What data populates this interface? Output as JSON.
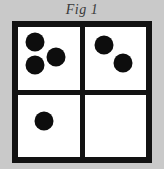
{
  "figure": {
    "caption": "Fig 1",
    "colors": {
      "background": "#c9c9c9",
      "frame": "#121212",
      "cell": "#ffffff",
      "dot": "#0d0d0d"
    },
    "frame": {
      "border_px": 6,
      "divider_px": 5
    },
    "quadrants": [
      {
        "name": "top-left",
        "dot_count": 3,
        "dots": [
          {
            "cx_pct": 28,
            "cy_pct": 24,
            "d_px": 19
          },
          {
            "cx_pct": 27,
            "cy_pct": 60,
            "d_px": 19
          },
          {
            "cx_pct": 62,
            "cy_pct": 48,
            "d_px": 19
          }
        ]
      },
      {
        "name": "top-right",
        "dot_count": 2,
        "dots": [
          {
            "cx_pct": 32,
            "cy_pct": 28,
            "d_px": 19
          },
          {
            "cx_pct": 63,
            "cy_pct": 57,
            "d_px": 19
          }
        ]
      },
      {
        "name": "bottom-left",
        "dot_count": 1,
        "dots": [
          {
            "cx_pct": 43,
            "cy_pct": 42,
            "d_px": 19
          }
        ]
      },
      {
        "name": "bottom-right",
        "dot_count": 0,
        "dots": []
      }
    ]
  }
}
